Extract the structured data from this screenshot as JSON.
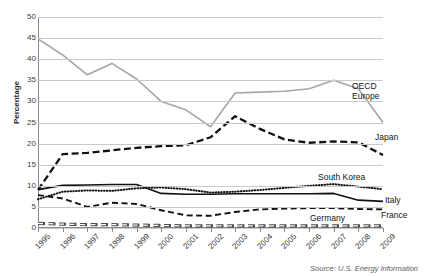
{
  "chart_data": {
    "type": "line",
    "title": "",
    "xlabel": "",
    "ylabel": "Percentage",
    "ylim": [
      0,
      50
    ],
    "ytick_step": 5,
    "grid": true,
    "legend_position": "inline-right-of-series",
    "source": "Source: U.S. Energy Information",
    "categories": [
      "1995",
      "1996",
      "1997",
      "1998",
      "1999",
      "2000",
      "2001",
      "2002",
      "2003",
      "2004",
      "2005",
      "2006",
      "2007",
      "2008",
      "2009"
    ],
    "yticks": [
      "0",
      "5",
      "10",
      "15",
      "20",
      "25",
      "30",
      "35",
      "40",
      "45",
      "50"
    ],
    "series": [
      {
        "name": "OECD Europe",
        "style": "solid",
        "color": "#a6a6a6",
        "values": [
          44.8,
          41.0,
          36.3,
          39.0,
          35.3,
          30.0,
          28.0,
          24.0,
          32.0,
          32.2,
          32.4,
          33.0,
          35.0,
          33.0,
          25.0
        ]
      },
      {
        "name": "Japan",
        "style": "dashed",
        "color": "#111111",
        "values": [
          9.0,
          17.5,
          17.8,
          18.4,
          19.0,
          19.4,
          19.6,
          21.5,
          26.5,
          23.5,
          21.0,
          20.2,
          20.5,
          20.3,
          17.3
        ]
      },
      {
        "name": "South Korea",
        "style": "dotted",
        "color": "#111111",
        "values": [
          6.8,
          8.6,
          8.9,
          8.8,
          9.4,
          9.6,
          9.2,
          8.4,
          8.6,
          9.0,
          9.5,
          10.0,
          10.4,
          9.8,
          9.2
        ]
      },
      {
        "name": "Italy",
        "style": "solid",
        "color": "#111111",
        "values": [
          9.1,
          10.1,
          10.2,
          10.3,
          10.3,
          8.2,
          8.0,
          8.0,
          8.1,
          8.1,
          8.1,
          8.1,
          8.2,
          6.6,
          6.3
        ]
      },
      {
        "name": "France",
        "style": "dashed-long",
        "color": "#111111",
        "values": [
          7.8,
          7.0,
          5.0,
          6.0,
          5.7,
          4.2,
          3.0,
          2.9,
          3.8,
          4.4,
          4.6,
          4.7,
          4.7,
          4.5,
          4.4
        ]
      },
      {
        "name": "Germany",
        "style": "dash-box",
        "color": "#4d4d4d",
        "values": [
          1.1,
          0.9,
          0.8,
          0.8,
          0.7,
          0.6,
          0.5,
          0.5,
          0.5,
          0.5,
          0.5,
          0.5,
          0.5,
          0.5,
          0.5
        ]
      }
    ],
    "annotations": [
      {
        "label": "OECD",
        "line2": "Europe"
      },
      {
        "label": "Japan"
      },
      {
        "label": "South Korea"
      },
      {
        "label": "Italy"
      },
      {
        "label": "France"
      },
      {
        "label": "Germany"
      }
    ]
  },
  "labels": {
    "oecd_europe_line1": "OECD",
    "oecd_europe_line2": "Europe",
    "japan": "Japan",
    "south_korea": "South Korea",
    "italy": "Italy",
    "france": "France",
    "germany": "Germany"
  }
}
